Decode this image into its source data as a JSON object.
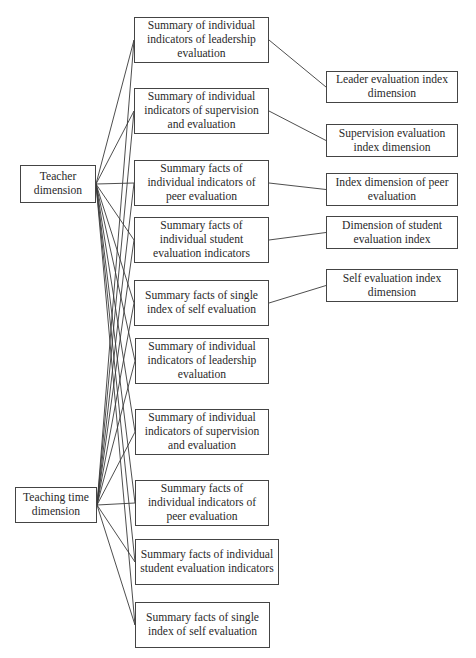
{
  "diagram": {
    "type": "hierarchical-network",
    "source_nodes": [
      {
        "id": "teacher",
        "label": "Teacher dimension"
      },
      {
        "id": "time",
        "label": "Teaching time dimension"
      }
    ],
    "middle_nodes": [
      {
        "id": "m1",
        "label": "Summary of individual indicators of leadership evaluation"
      },
      {
        "id": "m2",
        "label": "Summary of individual indicators of supervision and evaluation"
      },
      {
        "id": "m3",
        "label": "Summary facts of individual indicators of peer evaluation"
      },
      {
        "id": "m4",
        "label": "Summary facts of individual student evaluation indicators"
      },
      {
        "id": "m5",
        "label": "Summary facts of single index of self evaluation"
      },
      {
        "id": "m6",
        "label": "Summary of individual indicators of leadership evaluation"
      },
      {
        "id": "m7",
        "label": "Summary of individual indicators of supervision and evaluation"
      },
      {
        "id": "m8",
        "label": "Summary facts of individual indicators of peer evaluation"
      },
      {
        "id": "m9",
        "label": "Summary facts of individual student evaluation indicators"
      },
      {
        "id": "m10",
        "label": "Summary facts of single index of self evaluation"
      }
    ],
    "target_nodes": [
      {
        "id": "t1",
        "label": "Leader evaluation index dimension"
      },
      {
        "id": "t2",
        "label": "Supervision evaluation index dimension"
      },
      {
        "id": "t3",
        "label": "Index dimension of peer evaluation"
      },
      {
        "id": "t4",
        "label": "Dimension of student evaluation index"
      },
      {
        "id": "t5",
        "label": "Self evaluation index dimension"
      }
    ],
    "edges": [
      [
        "teacher",
        "m1"
      ],
      [
        "teacher",
        "m2"
      ],
      [
        "teacher",
        "m3"
      ],
      [
        "teacher",
        "m4"
      ],
      [
        "teacher",
        "m5"
      ],
      [
        "teacher",
        "m6"
      ],
      [
        "teacher",
        "m7"
      ],
      [
        "teacher",
        "m8"
      ],
      [
        "teacher",
        "m9"
      ],
      [
        "teacher",
        "m10"
      ],
      [
        "time",
        "m1"
      ],
      [
        "time",
        "m2"
      ],
      [
        "time",
        "m3"
      ],
      [
        "time",
        "m4"
      ],
      [
        "time",
        "m5"
      ],
      [
        "time",
        "m6"
      ],
      [
        "time",
        "m7"
      ],
      [
        "time",
        "m8"
      ],
      [
        "time",
        "m9"
      ],
      [
        "time",
        "m10"
      ],
      [
        "m1",
        "t1"
      ],
      [
        "m2",
        "t2"
      ],
      [
        "m3",
        "t3"
      ],
      [
        "m4",
        "t4"
      ],
      [
        "m5",
        "t5"
      ]
    ]
  }
}
